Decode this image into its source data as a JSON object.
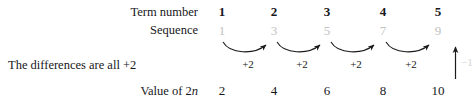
{
  "diagram": {
    "labels": {
      "term_number": "Term number",
      "sequence": "Sequence",
      "differences": "The differences are all +2",
      "value_of": "Value of 2",
      "value_of_var": "n"
    },
    "term_numbers": [
      "1",
      "2",
      "3",
      "4",
      "5"
    ],
    "sequence_values": [
      "1",
      "3",
      "5",
      "7",
      "9"
    ],
    "difference_labels": [
      "+2",
      "+2",
      "+2",
      "+2"
    ],
    "value_row": [
      "2",
      "4",
      "6",
      "8",
      "10"
    ],
    "offset_annotation": "−1",
    "colors": {
      "text": "#17171a",
      "sequence_gray": "#c2c2c2",
      "annotation_gray": "#d2d2d2",
      "arrow": "#1b1b1b",
      "background": "#ffffff"
    }
  }
}
